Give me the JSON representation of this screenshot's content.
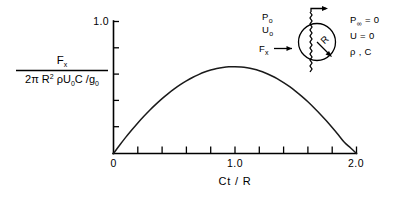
{
  "figure": {
    "y_axis_label_numerator": "F",
    "y_axis_label_numerator_sub": "x",
    "y_axis_label_denominator_prefix": "2π R",
    "y_axis_label_denominator_exp": "2",
    "y_axis_label_denominator_rest": " ρU",
    "y_axis_label_denominator_sub1": "0",
    "y_axis_label_denominator_mid": "C /g",
    "y_axis_label_denominator_sub2": "0",
    "x_axis_title": "Ct / R",
    "y_tick_top": "1.0",
    "x_tick_origin": "0",
    "x_tick_mid": "1.0",
    "x_tick_end": "2.0"
  },
  "inset": {
    "upstream_pressure": "P",
    "upstream_pressure_sub": "o",
    "upstream_velocity": "U",
    "upstream_velocity_sub": "o",
    "force_label": "F",
    "force_label_sub": "x",
    "radius_label": "R",
    "far_pressure": "P",
    "far_pressure_sub": "∞",
    "far_pressure_value": " = 0",
    "far_velocity": "U = 0",
    "properties": "ρ , C"
  },
  "chart_data": {
    "type": "line",
    "title": "",
    "xlabel": "Ct / R",
    "ylabel": "Fx / (2π R² ρU₀C/g₀)",
    "xlim": [
      0,
      2.0
    ],
    "ylim": [
      0,
      1.0
    ],
    "grid": false,
    "legend": "none",
    "x_major_ticks": [
      0,
      1.0,
      2.0
    ],
    "x_major_tick_labels": [
      "0",
      "1.0",
      "2.0"
    ],
    "x_minor_tick_count_per_interval": 4,
    "y_major_ticks": [
      0,
      1.0
    ],
    "y_major_tick_labels": [
      "",
      "1.0"
    ],
    "y_minor_ticks": [
      0.2,
      0.4,
      0.6,
      0.8
    ],
    "series": [
      {
        "name": "Fx normalized",
        "x": [
          0.0,
          0.05,
          0.1,
          0.15,
          0.2,
          0.25,
          0.3,
          0.35,
          0.4,
          0.45,
          0.5,
          0.55,
          0.6,
          0.65,
          0.7,
          0.75,
          0.8,
          0.85,
          0.9,
          0.95,
          1.0,
          1.05,
          1.1,
          1.15,
          1.2,
          1.25,
          1.3,
          1.35,
          1.4,
          1.45,
          1.5,
          1.55,
          1.6,
          1.65,
          1.7,
          1.75,
          1.8,
          1.85,
          1.9,
          1.95,
          2.0
        ],
        "y": [
          0.0,
          0.062,
          0.122,
          0.178,
          0.232,
          0.282,
          0.33,
          0.374,
          0.416,
          0.454,
          0.489,
          0.521,
          0.55,
          0.576,
          0.598,
          0.617,
          0.632,
          0.644,
          0.652,
          0.657,
          0.658,
          0.656,
          0.65,
          0.64,
          0.627,
          0.61,
          0.589,
          0.565,
          0.537,
          0.506,
          0.471,
          0.433,
          0.392,
          0.347,
          0.3,
          0.25,
          0.197,
          0.142,
          0.085,
          0.043,
          0.0
        ]
      }
    ]
  }
}
